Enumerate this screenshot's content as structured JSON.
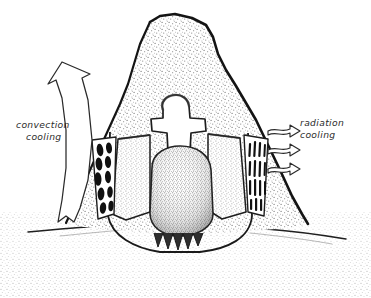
{
  "figure": {
    "view": "vertical cross-section",
    "style": "hand-drawn pen-and-ink stipple illustration",
    "background_color": "#ffffff",
    "ink_color": "#1a1a1a",
    "stipple_color": "#9a9a9a",
    "duct_fill_color": "#111111"
  },
  "annotations": {
    "convection": {
      "line1": "convection",
      "line2": "cooling",
      "arrow_name": "convection-arrow",
      "arrow_count": 1,
      "arrow_direction": "up",
      "side": "left"
    },
    "radiation": {
      "line1": "radiation",
      "line2": "cooling",
      "arrow_name": "radiation-arrow",
      "arrow_count": 3,
      "arrow_direction": "right",
      "side": "right"
    }
  },
  "structures": [
    {
      "name": "mound-body",
      "label": "mound body"
    },
    {
      "name": "central-chimney",
      "label": "central chimney void"
    },
    {
      "name": "nest-chamber",
      "label": "nest chamber"
    },
    {
      "name": "left-ventilation-ducts",
      "label": "left ventilation ducts"
    },
    {
      "name": "right-ventilation-ducts",
      "label": "right ventilation ducts"
    },
    {
      "name": "ground-line",
      "label": "ground surface"
    },
    {
      "name": "root-teeth",
      "label": "basal projections"
    }
  ]
}
